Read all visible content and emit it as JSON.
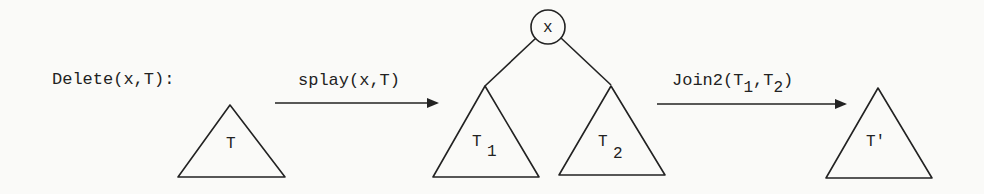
{
  "diagram": {
    "title": "Delete(x,T):",
    "steps": [
      {
        "id": "step1",
        "label": "splay(x,T)"
      },
      {
        "id": "step2",
        "label_main": "Join2(T",
        "label_sub1": "1",
        "label_mid": ",T",
        "label_sub2": "2",
        "label_end": ")"
      }
    ],
    "nodes": {
      "input_tree": {
        "label": "T"
      },
      "root": {
        "label": "x"
      },
      "left_subtree": {
        "label": "T",
        "subscript": "1"
      },
      "right_subtree": {
        "label": "T",
        "subscript": "2"
      },
      "result_tree": {
        "label": "T'"
      }
    },
    "colors": {
      "stroke": "#222222",
      "background": "#fafaf8"
    }
  }
}
